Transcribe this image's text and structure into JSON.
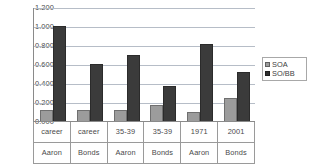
{
  "chart_data": {
    "type": "bar",
    "title": "",
    "xlabel": "",
    "ylabel": "",
    "ylim": [
      0.0,
      1.2
    ],
    "ytick_labels": [
      "1.200",
      "1.000",
      "0.800",
      "0.600",
      "0.400",
      "0.200",
      "0.000"
    ],
    "ytick_values": [
      1.2,
      1.0,
      0.8,
      0.6,
      0.4,
      0.2,
      0.0
    ],
    "grid": true,
    "legend_position": "right",
    "categories": [
      "career Aaron",
      "career Bonds",
      "35-39 Aaron",
      "35-39 Bonds",
      "1971 Aaron",
      "2001 Bonds"
    ],
    "category_rows": [
      [
        "career",
        "career",
        "35-39",
        "35-39",
        "1971",
        "2001"
      ],
      [
        "Aaron",
        "Bonds",
        "Aaron",
        "Bonds",
        "Aaron",
        "Bonds"
      ]
    ],
    "series": [
      {
        "name": "SOA",
        "color": "#9c9c9c",
        "values": [
          0.12,
          0.12,
          0.12,
          0.17,
          0.1,
          0.24
        ]
      },
      {
        "name": "SO/BB",
        "color": "#3b3b3b",
        "values": [
          1.0,
          0.6,
          0.7,
          0.37,
          0.81,
          0.52
        ]
      }
    ]
  },
  "legend": {
    "items": [
      {
        "label": "SOA",
        "swatch": "soa"
      },
      {
        "label": "SO/BB",
        "swatch": "sobb"
      }
    ]
  }
}
